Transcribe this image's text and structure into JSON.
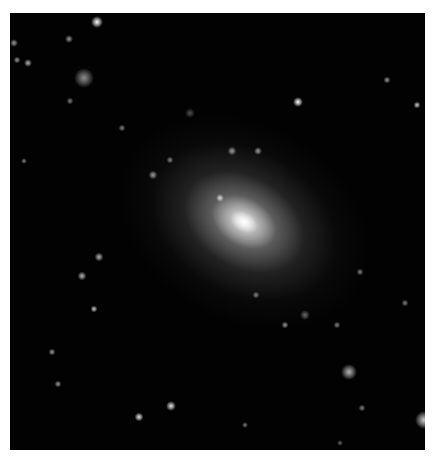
{
  "image": {
    "subject": "elliptical-galaxy",
    "background_color": "#020202",
    "page_color": "#ffffff"
  },
  "galaxy": {
    "cx": 234,
    "cy": 209,
    "layers": [
      {
        "w": 270,
        "h": 200,
        "color": "rgba(120,120,120,0.22)"
      },
      {
        "w": 200,
        "h": 145,
        "color": "rgba(160,160,160,0.35)"
      },
      {
        "w": 130,
        "h": 92,
        "color": "rgba(205,205,205,0.55)"
      },
      {
        "w": 70,
        "h": 48,
        "color": "rgba(240,240,240,0.85)"
      },
      {
        "w": 30,
        "h": 20,
        "color": "rgba(255,255,255,1)"
      }
    ]
  },
  "objects": [
    {
      "x": 87,
      "y": 9,
      "r": 4,
      "b": 1.0
    },
    {
      "x": 74,
      "y": 65,
      "r": 8,
      "b": 0.55
    },
    {
      "x": 288,
      "y": 89,
      "r": 3,
      "b": 1.0
    },
    {
      "x": 339,
      "y": 359,
      "r": 6,
      "b": 0.7
    },
    {
      "x": 414,
      "y": 407,
      "r": 7,
      "b": 0.8
    },
    {
      "x": 161,
      "y": 393,
      "r": 3,
      "b": 0.9
    },
    {
      "x": 129,
      "y": 404,
      "r": 2.5,
      "b": 0.9
    },
    {
      "x": 4,
      "y": 30,
      "r": 2,
      "b": 0.6
    },
    {
      "x": 59,
      "y": 26,
      "r": 2,
      "b": 0.6
    },
    {
      "x": 18,
      "y": 50,
      "r": 2,
      "b": 0.7
    },
    {
      "x": 7,
      "y": 47,
      "r": 1.5,
      "b": 0.6
    },
    {
      "x": 222,
      "y": 138,
      "r": 2.5,
      "b": 0.6
    },
    {
      "x": 248,
      "y": 138,
      "r": 2,
      "b": 0.6
    },
    {
      "x": 143,
      "y": 162,
      "r": 2.5,
      "b": 0.6
    },
    {
      "x": 89,
      "y": 244,
      "r": 2.5,
      "b": 0.7
    },
    {
      "x": 72,
      "y": 263,
      "r": 2.5,
      "b": 0.7
    },
    {
      "x": 84,
      "y": 296,
      "r": 1.5,
      "b": 0.8
    },
    {
      "x": 407,
      "y": 92,
      "r": 1.5,
      "b": 0.8
    },
    {
      "x": 377,
      "y": 67,
      "r": 1.5,
      "b": 0.6
    },
    {
      "x": 180,
      "y": 100,
      "r": 3,
      "b": 0.3
    },
    {
      "x": 350,
      "y": 259,
      "r": 1.5,
      "b": 0.5
    },
    {
      "x": 295,
      "y": 302,
      "r": 3,
      "b": 0.4
    },
    {
      "x": 210,
      "y": 185,
      "r": 2,
      "b": 0.8
    },
    {
      "x": 327,
      "y": 312,
      "r": 1.5,
      "b": 0.5
    },
    {
      "x": 275,
      "y": 312,
      "r": 1.5,
      "b": 0.6
    },
    {
      "x": 246,
      "y": 282,
      "r": 1.5,
      "b": 0.5
    },
    {
      "x": 42,
      "y": 339,
      "r": 1.5,
      "b": 0.6
    },
    {
      "x": 48,
      "y": 371,
      "r": 1.5,
      "b": 0.6
    },
    {
      "x": 352,
      "y": 395,
      "r": 1.5,
      "b": 0.5
    },
    {
      "x": 160,
      "y": 147,
      "r": 1.5,
      "b": 0.5
    },
    {
      "x": 112,
      "y": 115,
      "r": 1.5,
      "b": 0.5
    },
    {
      "x": 60,
      "y": 88,
      "r": 1.5,
      "b": 0.5
    },
    {
      "x": 14,
      "y": 148,
      "r": 1,
      "b": 0.5
    },
    {
      "x": 395,
      "y": 290,
      "r": 1.5,
      "b": 0.5
    },
    {
      "x": 235,
      "y": 412,
      "r": 1,
      "b": 0.5
    },
    {
      "x": 330,
      "y": 430,
      "r": 1,
      "b": 0.4
    }
  ]
}
